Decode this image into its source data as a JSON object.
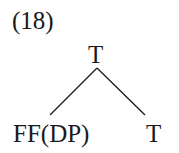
{
  "example_number": "(18)",
  "tree": {
    "root": "T",
    "left_child": "FF(DP)",
    "right_child": "T"
  }
}
